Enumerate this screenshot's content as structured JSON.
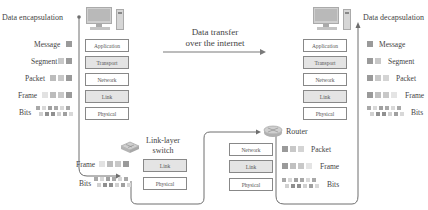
{
  "header": {
    "left_title": "Data encapsulation",
    "right_title": "Data decapsulation",
    "center_line1": "Data transfer",
    "center_line2": "over the internet"
  },
  "layers": {
    "application": "Application",
    "transport": "Transport",
    "network": "Network",
    "link": "Link",
    "physical": "Physical"
  },
  "pdu_labels": {
    "message": "Message",
    "segment": "Segment",
    "packet": "Packet",
    "frame": "Frame",
    "bits": "Bits"
  },
  "devices": {
    "switch_line1": "Link-layer",
    "switch_line2": "switch",
    "router": "Router"
  },
  "icons": {
    "computer": "desktop-computer-icon",
    "switch": "network-switch-icon",
    "router": "router-icon"
  },
  "colors": {
    "dark": "#8e8e8e",
    "mid": "#b4b4b4",
    "light": "#d0d0d0",
    "pale": "#e6e6e6",
    "line": "#6e6e6e",
    "shaded_layer": "#e4e4e4"
  }
}
